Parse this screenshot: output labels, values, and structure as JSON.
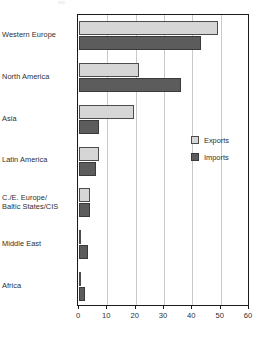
{
  "chart_data": {
    "type": "bar",
    "orientation": "horizontal",
    "title": "",
    "xlabel": "",
    "ylabel": "",
    "xlim": [
      0,
      60
    ],
    "xticks": [
      0,
      10,
      20,
      30,
      40,
      50,
      60
    ],
    "xtick_labels": [
      "0",
      "10",
      "20",
      "30",
      "40",
      "50",
      "60"
    ],
    "grid": "vertical",
    "legend_position": "inside-right",
    "categories": [
      "Western Europe",
      "North America",
      "Asia",
      "Latin America",
      "C./E. Europe/\nBaltic States/CIS",
      "Middle East",
      "Africa"
    ],
    "series": [
      {
        "name": "Exports",
        "color": "#d6d6d6",
        "edge_color": "#4c4c4c",
        "values": [
          49,
          21,
          19.5,
          7,
          4,
          0.3,
          0.3
        ]
      },
      {
        "name": "Imports",
        "color": "#5c5c5c",
        "edge_color": "#3a3a3a",
        "values": [
          43,
          36,
          7,
          6,
          4,
          3,
          2
        ]
      }
    ]
  },
  "legend": {
    "entries": [
      {
        "label": "Exports",
        "swatch": "exports"
      },
      {
        "label": "Imports",
        "swatch": "imports"
      }
    ]
  },
  "axis": {
    "frame_color": "#1b1b1b",
    "grid_color": "#c9c9c9"
  }
}
